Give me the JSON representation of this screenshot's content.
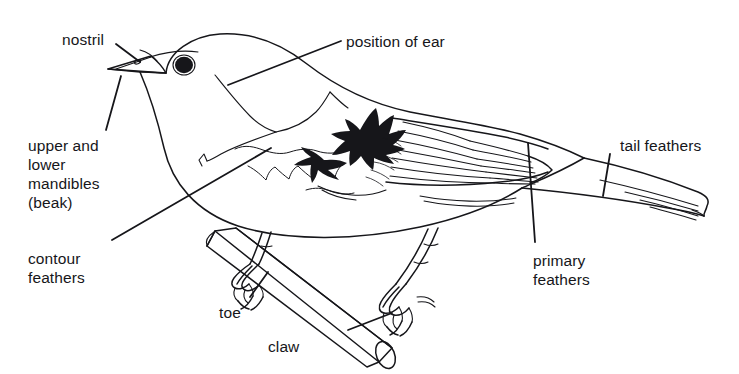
{
  "figure": {
    "style": "black-and-white line drawing",
    "background_color": "#ffffff",
    "ink_color": "#16161a",
    "width": 739,
    "height": 374
  },
  "labels": [
    {
      "id": "nostril",
      "text": "nostril",
      "x": 62,
      "y": 30,
      "align": "left"
    },
    {
      "id": "position-of-ear",
      "text": "position of ear",
      "x": 346,
      "y": 32,
      "align": "left"
    },
    {
      "id": "upper-lower-mandibles",
      "text": "upper and\nlower\nmandibles\n(beak)",
      "x": 28,
      "y": 136,
      "align": "left"
    },
    {
      "id": "contour-feathers",
      "text": "contour\nfeathers",
      "x": 28,
      "y": 249,
      "align": "left"
    },
    {
      "id": "tail-feathers",
      "text": "tail feathers",
      "x": 620,
      "y": 136,
      "align": "left"
    },
    {
      "id": "primary-feathers",
      "text": "primary\nfeathers",
      "x": 533,
      "y": 251,
      "align": "left"
    },
    {
      "id": "toe",
      "text": "toe",
      "x": 219,
      "y": 303,
      "align": "left"
    },
    {
      "id": "claw",
      "text": "claw",
      "x": 268,
      "y": 337,
      "align": "left"
    }
  ],
  "parts": [
    {
      "id": "beak",
      "name": "upper and lower mandibles (beak)"
    },
    {
      "id": "nostril",
      "name": "nostril"
    },
    {
      "id": "eye",
      "name": "eye"
    },
    {
      "id": "ear-position",
      "name": "position of ear"
    },
    {
      "id": "contour-feathers",
      "name": "contour feathers"
    },
    {
      "id": "wing-coverts",
      "name": "dark wing covert patch"
    },
    {
      "id": "primary-feathers",
      "name": "primary feathers"
    },
    {
      "id": "tail-feathers",
      "name": "tail feathers"
    },
    {
      "id": "leg",
      "name": "leg"
    },
    {
      "id": "toe",
      "name": "toe"
    },
    {
      "id": "claw",
      "name": "claw"
    },
    {
      "id": "branch",
      "name": "branch perch"
    }
  ]
}
